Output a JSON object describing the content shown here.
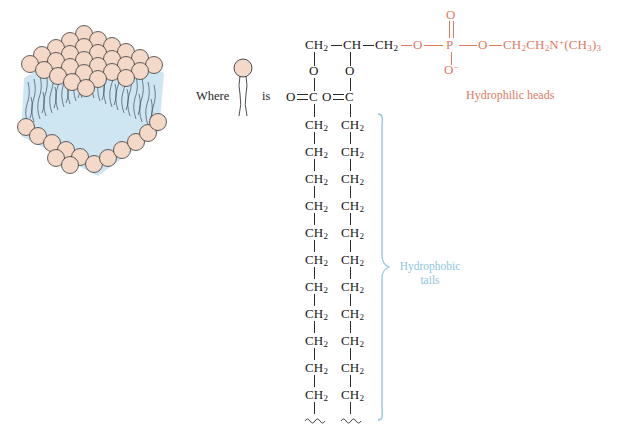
{
  "figure": {
    "background": "#ffffff",
    "head_color": "#e1795f",
    "tail_color": "#8fc4de",
    "bond_color": "#2b2b2b",
    "sphere_fill": "#f4d8c8",
    "tail_region_fill": "#cfe6f2"
  },
  "legend": {
    "where_label": "Where",
    "is_label": "is",
    "symbol_name": "phospholipid-lollipop-symbol"
  },
  "labels": {
    "hydrophilic_heads": "Hydrophilic heads",
    "hydrophobic_tails_line1": "Hydrophobic",
    "hydrophobic_tails_line2": "tails"
  },
  "molecule": {
    "backbone": [
      {
        "text": "CH",
        "sub": "2"
      },
      {
        "text": "CH",
        "sub": ""
      },
      {
        "text": "CH",
        "sub": "2"
      }
    ],
    "backbone_oxygens": [
      "O",
      "O"
    ],
    "ester_groups": [
      {
        "oxygen": "O",
        "carbon": "C"
      },
      {
        "oxygen": "O",
        "carbon": "C"
      }
    ],
    "phosphate": {
      "ester_oxygen_left": "O",
      "double_bond_oxygen": "O",
      "phosphorus": "P",
      "anionic_oxygen": "O",
      "anionic_charge": "−",
      "ester_oxygen_right": "O"
    },
    "choline": {
      "segment1": "CH",
      "segment1_sub": "2",
      "segment2": "CH",
      "segment2_sub": "2",
      "nitrogen": "N",
      "nitrogen_charge": "+",
      "methyls_open": "(CH",
      "methyls_sub": "3",
      "methyls_close": ")",
      "methyls_count": "3"
    },
    "tail_unit": {
      "text": "CH",
      "sub": "2"
    },
    "tail_units_per_chain": 11,
    "tail_terminator": "squiggle",
    "chain_count": 2
  },
  "bilayer": {
    "name": "lipid-bilayer-illustration",
    "description": "Three-dimensional block of phospholipid bilayer with spherical heads and wavy tails"
  }
}
